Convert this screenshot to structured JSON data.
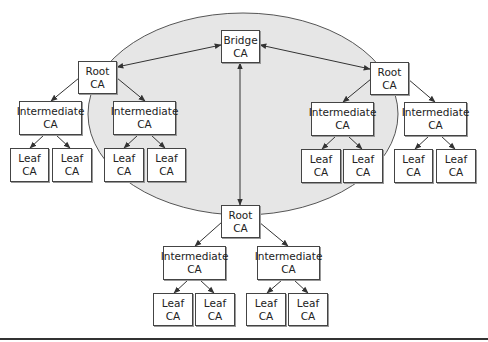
{
  "diagram": {
    "colors": {
      "ellipse_fill": "#e6e6e6",
      "ellipse_stroke": "#555555",
      "box_border": "#444444",
      "edge": "#333333"
    },
    "ellipse": {
      "cx": 243,
      "cy": 114,
      "rx": 155,
      "ry": 101
    },
    "nodes": [
      {
        "id": "bridge",
        "line1": "Bridge",
        "line2": "CA",
        "x": 221,
        "y": 30,
        "w": 39,
        "h": 33
      },
      {
        "id": "root-left",
        "line1": "Root",
        "line2": "CA",
        "x": 78,
        "y": 61,
        "w": 39,
        "h": 33
      },
      {
        "id": "root-right",
        "line1": "Root",
        "line2": "CA",
        "x": 370,
        "y": 62,
        "w": 39,
        "h": 33
      },
      {
        "id": "root-bottom",
        "line1": "Root",
        "line2": "CA",
        "x": 221,
        "y": 205,
        "w": 39,
        "h": 33
      },
      {
        "id": "int-l1",
        "line1": "Intermediate",
        "line2": "CA",
        "x": 19,
        "y": 101,
        "w": 63,
        "h": 34
      },
      {
        "id": "int-l2",
        "line1": "Intermediate",
        "line2": "CA",
        "x": 113,
        "y": 101,
        "w": 63,
        "h": 34
      },
      {
        "id": "int-r1",
        "line1": "Intermediate",
        "line2": "CA",
        "x": 311,
        "y": 102,
        "w": 63,
        "h": 34
      },
      {
        "id": "int-r2",
        "line1": "Intermediate",
        "line2": "CA",
        "x": 404,
        "y": 102,
        "w": 63,
        "h": 34
      },
      {
        "id": "int-b1",
        "line1": "Intermediate",
        "line2": "CA",
        "x": 163,
        "y": 246,
        "w": 63,
        "h": 34
      },
      {
        "id": "int-b2",
        "line1": "Intermediate",
        "line2": "CA",
        "x": 257,
        "y": 246,
        "w": 63,
        "h": 34
      },
      {
        "id": "leaf-l1",
        "line1": "Leaf",
        "line2": "CA",
        "x": 10,
        "y": 148,
        "w": 39,
        "h": 34
      },
      {
        "id": "leaf-l2",
        "line1": "Leaf",
        "line2": "CA",
        "x": 52,
        "y": 148,
        "w": 40,
        "h": 34
      },
      {
        "id": "leaf-l3",
        "line1": "Leaf",
        "line2": "CA",
        "x": 104,
        "y": 148,
        "w": 40,
        "h": 34
      },
      {
        "id": "leaf-l4",
        "line1": "Leaf",
        "line2": "CA",
        "x": 147,
        "y": 148,
        "w": 39,
        "h": 34
      },
      {
        "id": "leaf-r1",
        "line1": "Leaf",
        "line2": "CA",
        "x": 301,
        "y": 149,
        "w": 40,
        "h": 34
      },
      {
        "id": "leaf-r2",
        "line1": "Leaf",
        "line2": "CA",
        "x": 343,
        "y": 149,
        "w": 40,
        "h": 34
      },
      {
        "id": "leaf-r3",
        "line1": "Leaf",
        "line2": "CA",
        "x": 394,
        "y": 149,
        "w": 39,
        "h": 34
      },
      {
        "id": "leaf-r4",
        "line1": "Leaf",
        "line2": "CA",
        "x": 436,
        "y": 149,
        "w": 40,
        "h": 34
      },
      {
        "id": "leaf-b1",
        "line1": "Leaf",
        "line2": "CA",
        "x": 153,
        "y": 293,
        "w": 40,
        "h": 33
      },
      {
        "id": "leaf-b2",
        "line1": "Leaf",
        "line2": "CA",
        "x": 195,
        "y": 293,
        "w": 40,
        "h": 33
      },
      {
        "id": "leaf-b3",
        "line1": "Leaf",
        "line2": "CA",
        "x": 246,
        "y": 293,
        "w": 40,
        "h": 33
      },
      {
        "id": "leaf-b4",
        "line1": "Leaf",
        "line2": "CA",
        "x": 288,
        "y": 293,
        "w": 40,
        "h": 33
      }
    ],
    "edges": [
      {
        "from": "bridge",
        "to": "root-left",
        "type": "bidirectional",
        "x1": 221,
        "y1": 45,
        "x2": 117,
        "y2": 67
      },
      {
        "from": "bridge",
        "to": "root-right",
        "type": "bidirectional",
        "x1": 260,
        "y1": 45,
        "x2": 370,
        "y2": 69
      },
      {
        "from": "bridge",
        "to": "root-bottom",
        "type": "bidirectional",
        "x1": 240,
        "y1": 63,
        "x2": 240,
        "y2": 205
      },
      {
        "from": "root-left",
        "to": "int-l1",
        "type": "directed",
        "x1": 79,
        "y1": 78,
        "x2": 51,
        "y2": 101
      },
      {
        "from": "root-left",
        "to": "int-l2",
        "type": "directed",
        "x1": 117,
        "y1": 78,
        "x2": 145,
        "y2": 101
      },
      {
        "from": "int-l1",
        "to": "leaf-l1",
        "type": "directed",
        "x1": 44,
        "y1": 135,
        "x2": 30,
        "y2": 148
      },
      {
        "from": "int-l1",
        "to": "leaf-l2",
        "type": "directed",
        "x1": 56,
        "y1": 135,
        "x2": 70,
        "y2": 148
      },
      {
        "from": "int-l2",
        "to": "leaf-l3",
        "type": "directed",
        "x1": 138,
        "y1": 135,
        "x2": 124,
        "y2": 148
      },
      {
        "from": "int-l2",
        "to": "leaf-l4",
        "type": "directed",
        "x1": 151,
        "y1": 135,
        "x2": 165,
        "y2": 148
      },
      {
        "from": "root-right",
        "to": "int-r1",
        "type": "directed",
        "x1": 371,
        "y1": 79,
        "x2": 343,
        "y2": 102
      },
      {
        "from": "root-right",
        "to": "int-r2",
        "type": "directed",
        "x1": 408,
        "y1": 79,
        "x2": 435,
        "y2": 102
      },
      {
        "from": "int-r1",
        "to": "leaf-r1",
        "type": "directed",
        "x1": 336,
        "y1": 136,
        "x2": 322,
        "y2": 149
      },
      {
        "from": "int-r1",
        "to": "leaf-r2",
        "type": "directed",
        "x1": 348,
        "y1": 136,
        "x2": 362,
        "y2": 149
      },
      {
        "from": "int-r2",
        "to": "leaf-r3",
        "type": "directed",
        "x1": 429,
        "y1": 136,
        "x2": 415,
        "y2": 149
      },
      {
        "from": "int-r2",
        "to": "leaf-r4",
        "type": "directed",
        "x1": 441,
        "y1": 136,
        "x2": 455,
        "y2": 149
      },
      {
        "from": "root-bottom",
        "to": "int-b1",
        "type": "directed",
        "x1": 222,
        "y1": 222,
        "x2": 195,
        "y2": 246
      },
      {
        "from": "root-bottom",
        "to": "int-b2",
        "type": "directed",
        "x1": 259,
        "y1": 222,
        "x2": 288,
        "y2": 246
      },
      {
        "from": "int-b1",
        "to": "leaf-b1",
        "type": "directed",
        "x1": 188,
        "y1": 280,
        "x2": 174,
        "y2": 293
      },
      {
        "from": "int-b1",
        "to": "leaf-b2",
        "type": "directed",
        "x1": 200,
        "y1": 280,
        "x2": 214,
        "y2": 293
      },
      {
        "from": "int-b2",
        "to": "leaf-b3",
        "type": "directed",
        "x1": 282,
        "y1": 280,
        "x2": 267,
        "y2": 293
      },
      {
        "from": "int-b2",
        "to": "leaf-b4",
        "type": "directed",
        "x1": 294,
        "y1": 280,
        "x2": 308,
        "y2": 293
      }
    ]
  }
}
